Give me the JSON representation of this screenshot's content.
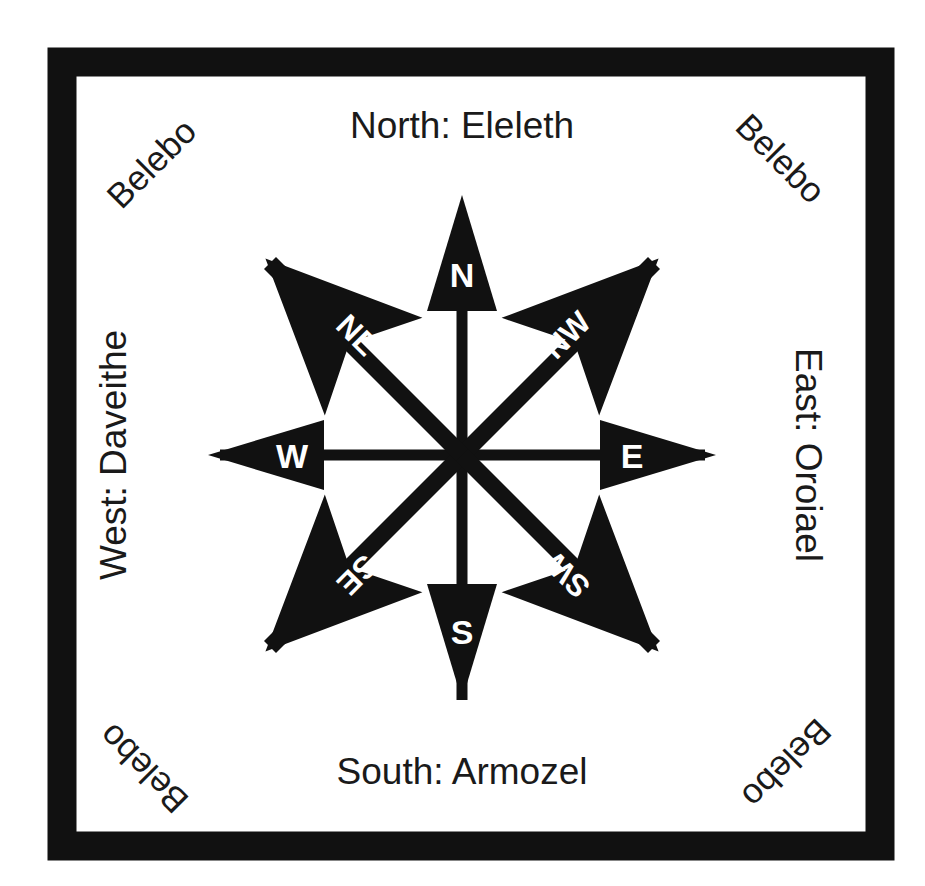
{
  "figure": {
    "type": "compass-rose",
    "title_visible": false,
    "background_color": "#ffffff",
    "ink_color": "#111111",
    "glyph_color": "#ffffff",
    "frame": {
      "style": "thick solid black rectangle",
      "color": "#111111"
    }
  },
  "cardinal_labels": {
    "north": "North: Eleleth",
    "east": "East: Oroiael",
    "south": "South: Armozel",
    "west": "West: Daveithe"
  },
  "corner_labels": {
    "top_left": "Belebo",
    "top_right": "Belebo",
    "bottom_left": "Belebo",
    "bottom_right": "Belebo"
  },
  "needles": [
    {
      "id": "n",
      "label": "N",
      "bearing_deg": 0,
      "kind": "cardinal"
    },
    {
      "id": "ne",
      "label": "NE",
      "bearing_deg": 45,
      "kind": "ordinal"
    },
    {
      "id": "e",
      "label": "E",
      "bearing_deg": 90,
      "kind": "cardinal"
    },
    {
      "id": "se",
      "label": "SE",
      "bearing_deg": 135,
      "kind": "ordinal"
    },
    {
      "id": "s",
      "label": "S",
      "bearing_deg": 180,
      "kind": "cardinal"
    },
    {
      "id": "sw",
      "label": "SW",
      "bearing_deg": 225,
      "kind": "ordinal"
    },
    {
      "id": "w",
      "label": "W",
      "bearing_deg": 270,
      "kind": "cardinal"
    },
    {
      "id": "nw",
      "label": "NW",
      "bearing_deg": 315,
      "kind": "ordinal"
    }
  ]
}
